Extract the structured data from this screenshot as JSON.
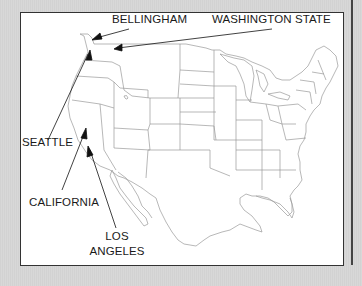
{
  "map": {
    "title": "",
    "region": "United States",
    "colors": {
      "background": "#d4d4d4",
      "map_fill": "#ffffff",
      "border_lines": "#9a9a9a",
      "frame": "#333333",
      "labels": "#1a1a1a",
      "arrows": "#111111"
    },
    "labels": [
      {
        "id": "bellingham",
        "text": "BELLINGHAM"
      },
      {
        "id": "washington_state",
        "text": "WASHINGTON STATE"
      },
      {
        "id": "seattle",
        "text": "SEATTLE"
      },
      {
        "id": "california",
        "text": "CALIFORNIA"
      },
      {
        "id": "los_angeles_line1",
        "text": "LOS"
      },
      {
        "id": "los_angeles_line2",
        "text": "ANGELES"
      }
    ]
  }
}
